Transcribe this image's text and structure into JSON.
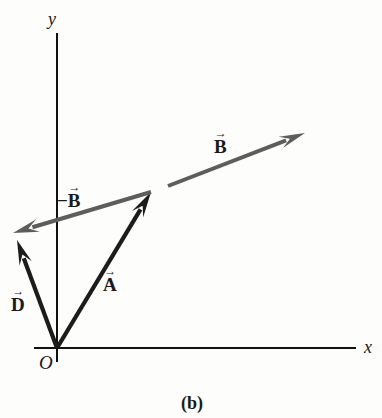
{
  "figure": {
    "caption": "(b)",
    "caption_x": 192,
    "caption_y": 394
  },
  "axes": {
    "x_label": "x",
    "y_label": "y",
    "origin_label": "O",
    "color": "#111111",
    "origin_x": 57,
    "origin_y": 348,
    "x_axis_end_x": 356,
    "y_axis_top_y": 33
  },
  "colors": {
    "black_vector": "#1c1c1c",
    "gray_vector": "#5d5d5d",
    "axis": "#111111",
    "text": "#1a1a1a",
    "background": "#fdfdfc"
  },
  "chart_data": {
    "type": "diagram",
    "title": "(b)",
    "xlabel": "x",
    "ylabel": "y",
    "grid": false,
    "legend": "none",
    "origin": {
      "label": "O",
      "x": 57,
      "y": 348
    },
    "vectors": [
      {
        "name": "A",
        "label": "A",
        "prefix": "",
        "color": "#1c1c1c",
        "style": "black",
        "tail": {
          "x": 57,
          "y": 348
        },
        "tip": {
          "x": 151,
          "y": 192
        },
        "thickness": 4.2,
        "head_length": 26,
        "head_width": 13,
        "label_x": 103,
        "label_y": 268
      },
      {
        "name": "B",
        "label": "B",
        "prefix": "",
        "color": "#5d5d5d",
        "style": "gray",
        "tail": {
          "x": 168,
          "y": 186
        },
        "tip": {
          "x": 305,
          "y": 133
        },
        "thickness": 4.0,
        "head_length": 26,
        "head_width": 12,
        "label_x": 214,
        "label_y": 130
      },
      {
        "name": "minus-B",
        "label": "B",
        "prefix": "−",
        "color": "#5d5d5d",
        "style": "gray",
        "tail": {
          "x": 151,
          "y": 192
        },
        "tip": {
          "x": 13,
          "y": 233
        },
        "thickness": 4.0,
        "head_length": 26,
        "head_width": 13,
        "label_x": 57,
        "label_y": 184
      },
      {
        "name": "D",
        "label": "D",
        "prefix": "",
        "color": "#1c1c1c",
        "style": "black",
        "tail": {
          "x": 57,
          "y": 348
        },
        "tip": {
          "x": 17,
          "y": 240
        },
        "thickness": 4.2,
        "head_length": 25,
        "head_width": 13,
        "label_x": 11,
        "label_y": 288
      }
    ]
  }
}
